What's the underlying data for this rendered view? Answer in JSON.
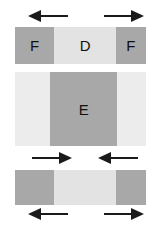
{
  "figure": {
    "canvas": {
      "width": 162,
      "height": 227,
      "background": "#ffffff"
    },
    "colors": {
      "dark_gray": "#a8a8a8",
      "light_gray": "#e3e3e3",
      "pale_gray": "#ececec",
      "arrow": "#1a1a1a",
      "label_text": "#111111"
    },
    "bars": [
      {
        "name": "top-bar",
        "x": 15,
        "y": 27,
        "width": 131,
        "height": 37,
        "segments": [
          {
            "name": "segment-f-left",
            "label": "F",
            "shade": "dark_gray",
            "width_pct": 30
          },
          {
            "name": "segment-d",
            "label": "D",
            "shade": "light_gray",
            "width_pct": 47
          },
          {
            "name": "segment-f-right",
            "label": "F",
            "shade": "dark_gray",
            "width_pct": 23
          }
        ]
      },
      {
        "name": "middle-bar",
        "x": 15,
        "y": 72,
        "width": 131,
        "height": 74,
        "segments": [
          {
            "name": "segment-light-left",
            "label": "",
            "shade": "pale_gray",
            "width_pct": 27
          },
          {
            "name": "segment-e",
            "label": "E",
            "shade": "dark_gray",
            "width_pct": 51
          },
          {
            "name": "segment-light-right",
            "label": "",
            "shade": "pale_gray",
            "width_pct": 22
          }
        ]
      },
      {
        "name": "bottom-bar",
        "x": 15,
        "y": 170,
        "width": 131,
        "height": 35,
        "segments": [
          {
            "name": "segment-dark-left",
            "label": "",
            "shade": "dark_gray",
            "width_pct": 30
          },
          {
            "name": "segment-center",
            "label": "",
            "shade": "light_gray",
            "width_pct": 47
          },
          {
            "name": "segment-dark-right",
            "label": "",
            "shade": "dark_gray",
            "width_pct": 23
          }
        ]
      }
    ],
    "arrows": [
      {
        "name": "arrow-top-left",
        "direction": "left",
        "x": 28,
        "y": 10,
        "width": 40
      },
      {
        "name": "arrow-top-right",
        "direction": "right",
        "x": 104,
        "y": 10,
        "width": 40
      },
      {
        "name": "arrow-mid-left",
        "direction": "right",
        "x": 32,
        "y": 152,
        "width": 40
      },
      {
        "name": "arrow-mid-right",
        "direction": "left",
        "x": 98,
        "y": 152,
        "width": 40
      },
      {
        "name": "arrow-bottom-left",
        "direction": "left",
        "x": 28,
        "y": 208,
        "width": 40
      },
      {
        "name": "arrow-bottom-right",
        "direction": "right",
        "x": 104,
        "y": 208,
        "width": 40
      }
    ]
  }
}
